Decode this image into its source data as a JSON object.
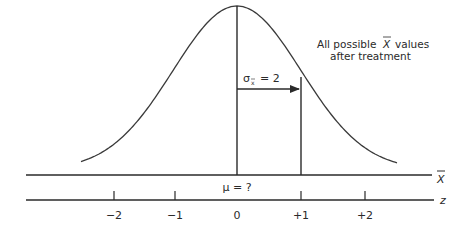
{
  "figure": {
    "annotation_line1": "All possible",
    "annotation_xbar": "X",
    "annotation_line1_rest": "values",
    "annotation_line2": "after treatment",
    "sigma_label_sym": "σ",
    "sigma_label_sub": "x",
    "sigma_label_rest": "= 2",
    "mu_label": "μ = ?",
    "xbar_axis_label": "X",
    "z_axis_label": "z",
    "z_ticks": [
      "−2",
      "−1",
      "0",
      "+1",
      "+2"
    ]
  },
  "colors": {
    "ink": "#2a2a2a",
    "background": "#ffffff"
  }
}
